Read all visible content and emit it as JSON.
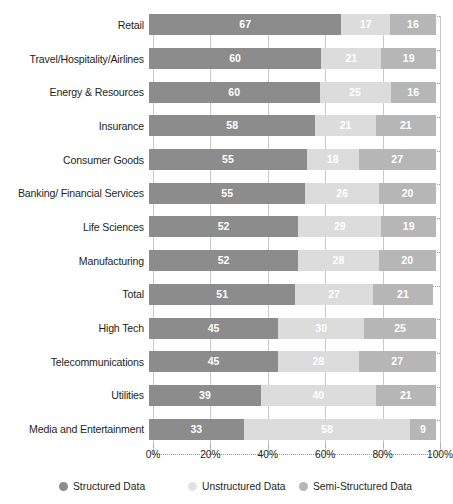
{
  "chart_data": {
    "type": "bar",
    "subtype": "stacked-horizontal-100pct",
    "title": "",
    "xlabel": "",
    "ylabel": "",
    "xlim": [
      0,
      100
    ],
    "grid": true,
    "legend_position": "bottom",
    "xticks": [
      "0%",
      "20%",
      "40%",
      "60%",
      "80%",
      "100%"
    ],
    "xtick_values": [
      0,
      20,
      40,
      60,
      80,
      100
    ],
    "categories": [
      "Retail",
      "Travel/Hospitality/Airlines",
      "Energy & Resources",
      "Insurance",
      "Consumer Goods",
      "Banking/ Financial Services",
      "Life Sciences",
      "Manufacturing",
      "Total",
      "High Tech",
      "Telecommunications",
      "Utilities",
      "Media and Entertainment"
    ],
    "series": [
      {
        "name": "Structured Data",
        "color": "#8c8c8c",
        "values": [
          67,
          60,
          60,
          58,
          55,
          55,
          52,
          52,
          51,
          45,
          45,
          39,
          33
        ]
      },
      {
        "name": "Unstructured Data",
        "color": "#dcdcdc",
        "values": [
          17,
          21,
          25,
          21,
          18,
          26,
          29,
          28,
          27,
          30,
          28,
          40,
          58
        ]
      },
      {
        "name": "Semi-Structured Data",
        "color": "#b6b6b6",
        "values": [
          16,
          19,
          16,
          21,
          27,
          20,
          19,
          20,
          21,
          25,
          27,
          21,
          9
        ]
      }
    ]
  }
}
